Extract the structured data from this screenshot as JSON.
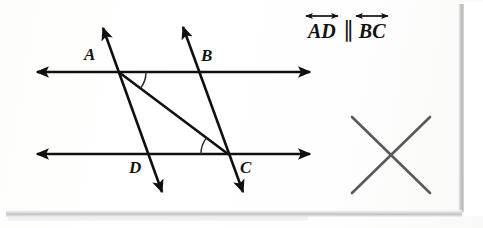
{
  "image": {
    "kind": "photographed-worksheet",
    "width": 483,
    "height": 228,
    "background_color": "#ffffff"
  },
  "diagram": {
    "ink_color": "#101010",
    "point_labels": [
      {
        "name": "A",
        "text": "A",
        "x": 84,
        "y": 46
      },
      {
        "name": "B",
        "text": "B",
        "x": 201,
        "y": 47
      },
      {
        "name": "D",
        "text": "D",
        "x": 129,
        "y": 159
      },
      {
        "name": "C",
        "text": "C",
        "x": 240,
        "y": 159
      }
    ],
    "lines": [
      {
        "name": "top-horizontal-line",
        "kind": "double-arrow-line",
        "x1": 37,
        "y1": 72,
        "x2": 310,
        "y2": 72
      },
      {
        "name": "bottom-horizontal-line",
        "kind": "double-arrow-line",
        "x1": 37,
        "y1": 154,
        "x2": 310,
        "y2": 154
      },
      {
        "name": "transversal-AD",
        "kind": "double-arrow-line",
        "x1": 103,
        "y1": 28,
        "x2": 162,
        "y2": 192
      },
      {
        "name": "transversal-BC",
        "kind": "double-arrow-line",
        "x1": 183,
        "y1": 27,
        "x2": 243,
        "y2": 192
      },
      {
        "name": "diagonal-segment-AC",
        "kind": "segment",
        "x1": 120,
        "y1": 73,
        "x2": 228,
        "y2": 154
      }
    ],
    "vertices": {
      "A": {
        "x": 120,
        "y": 72
      },
      "B": {
        "x": 198,
        "y": 72
      },
      "D": {
        "x": 147,
        "y": 154
      },
      "C": {
        "x": 227,
        "y": 154
      }
    },
    "angle_arcs": [
      {
        "name": "angle-arc-at-A",
        "cx": 120,
        "cy": 72,
        "r": 26
      },
      {
        "name": "angle-arc-at-C",
        "cx": 227,
        "cy": 154,
        "r": 26
      }
    ]
  },
  "statement": {
    "name": "parallel-statement",
    "first_line": "AD",
    "parallel_symbol": "∥",
    "second_line": "BC",
    "full_text": "AD ∥ BC"
  },
  "mark": {
    "name": "cross-out-mark",
    "symbol": "X",
    "color": "#5a5a5a",
    "center_x": 391,
    "center_y": 155,
    "half_size": 39
  }
}
